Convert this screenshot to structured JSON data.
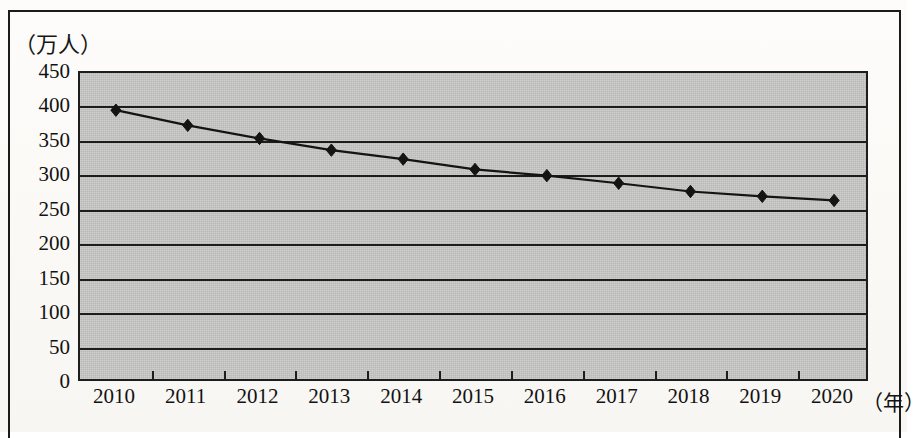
{
  "figure": {
    "y_unit_label": "（万人）",
    "x_unit_label": "（年）"
  },
  "chart_data": {
    "type": "line",
    "title": "",
    "subtitle": "",
    "xlabel": "（年）",
    "ylabel": "（万人）",
    "categories": [
      "2010",
      "2011",
      "2012",
      "2013",
      "2014",
      "2015",
      "2016",
      "2017",
      "2018",
      "2019",
      "2020"
    ],
    "values": [
      396,
      374,
      355,
      338,
      325,
      310,
      301,
      290,
      278,
      271,
      265
    ],
    "series": [
      {
        "name": "人数",
        "values": [
          396,
          374,
          355,
          338,
          325,
          310,
          301,
          290,
          278,
          271,
          265
        ]
      }
    ],
    "ylim": [
      0,
      450
    ],
    "ytick_step": 50,
    "yticks": [
      "450",
      "400",
      "350",
      "300",
      "250",
      "200",
      "150",
      "100",
      "50",
      "0"
    ],
    "ytick_values": [
      450,
      400,
      350,
      300,
      250,
      200,
      150,
      100,
      50,
      0
    ],
    "grid": true,
    "grid_axis": "y",
    "legend": false,
    "legend_position": "none",
    "marker": "diamond",
    "marker_color": "#141414",
    "line_color": "#141414",
    "plot_background": "#c9c9c7",
    "frame_color": "#1d1d1d",
    "annotations": []
  }
}
